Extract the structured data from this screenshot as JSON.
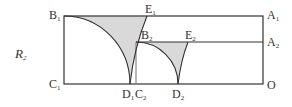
{
  "figure": {
    "region_label": {
      "letter": "R",
      "sub": "2"
    },
    "points": {
      "B1": {
        "letter": "B",
        "sub": "1"
      },
      "E1": {
        "letter": "E",
        "sub": "1"
      },
      "A1": {
        "letter": "A",
        "sub": "1"
      },
      "B2": {
        "letter": "B",
        "sub": "2"
      },
      "E2": {
        "letter": "E",
        "sub": "2"
      },
      "A2": {
        "letter": "A",
        "sub": "2"
      },
      "C1": {
        "letter": "C",
        "sub": "1"
      },
      "D1": {
        "letter": "D",
        "sub": "1"
      },
      "C2": {
        "letter": "C",
        "sub": "2"
      },
      "D2": {
        "letter": "D",
        "sub": "2"
      },
      "O": {
        "letter": "O",
        "sub": ""
      }
    },
    "colors": {
      "line": "#333333",
      "shade": "#d9d9d9"
    }
  }
}
